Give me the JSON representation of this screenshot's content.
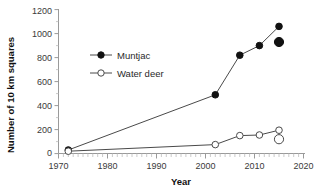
{
  "chart_data": {
    "type": "line",
    "title": "",
    "xlabel": "Year",
    "ylabel": "Number of 10 km squares",
    "xlim": [
      1970,
      2020
    ],
    "ylim": [
      0,
      1200
    ],
    "grid": false,
    "legend_position": "upper-left-inside",
    "x_ticks": [
      "1970",
      "1980",
      "1990",
      "2000",
      "2010",
      "2020"
    ],
    "x_tick_values": [
      1970,
      1980,
      1990,
      2000,
      2010,
      2020
    ],
    "y_ticks": [
      "0",
      "200",
      "400",
      "600",
      "800",
      "1000",
      "1200"
    ],
    "y_tick_values": [
      0,
      200,
      400,
      600,
      800,
      1000,
      1200
    ],
    "series": [
      {
        "name": "Muntjac",
        "marker": "filled-circle",
        "color": "#111111",
        "x": [
          1972,
          2002,
          2007,
          2011,
          2015
        ],
        "values": [
          30,
          490,
          820,
          900,
          1060
        ],
        "extra_point": {
          "x": 2015,
          "value": 930,
          "marker": "large-filled-circle"
        }
      },
      {
        "name": "Water deer",
        "marker": "open-circle",
        "color": "#4a4a4a",
        "x": [
          1972,
          2002,
          2007,
          2011,
          2015
        ],
        "values": [
          20,
          75,
          150,
          155,
          195
        ],
        "extra_point": {
          "x": 2015,
          "value": 120,
          "marker": "large-open-circle"
        }
      }
    ]
  },
  "legend": {
    "items": [
      {
        "label": "Muntjac",
        "marker": "filled-circle"
      },
      {
        "label": "Water deer",
        "marker": "open-circle"
      }
    ]
  }
}
